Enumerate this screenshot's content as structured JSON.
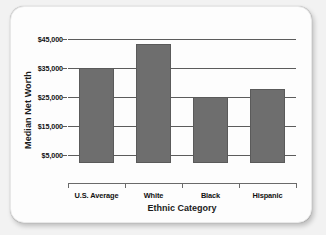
{
  "chart_data": {
    "type": "bar",
    "title": "",
    "xlabel": "Ethnic Category",
    "ylabel": "Median Net Worth",
    "categories": [
      "U.S. Average",
      "White",
      "Black",
      "Hispanic"
    ],
    "values": [
      35000,
      43000,
      25000,
      27500
    ],
    "ytick_labels": [
      "$45,000",
      "$35,000",
      "$25,000",
      "$15,000",
      "$5,000"
    ],
    "ytick_values": [
      45000,
      35000,
      25000,
      15000,
      5000
    ],
    "ylim": [
      0,
      49000
    ],
    "grid": true,
    "legend": "none",
    "bar_color": "#6e6e6e",
    "axis_color": "#5c5c5c",
    "card_background": "#fdfdfd",
    "page_background": "#f2f2f2"
  }
}
